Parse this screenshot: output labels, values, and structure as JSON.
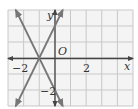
{
  "chart_data": {
    "type": "line",
    "title": "",
    "xlabel": "x",
    "ylabel": "y",
    "origin_label": "O",
    "xlim": [
      -3,
      5
    ],
    "ylim": [
      -3,
      3
    ],
    "grid": true,
    "grid_step": 1,
    "tick_labels": {
      "x": [
        {
          "value": -2,
          "label": "−2"
        },
        {
          "value": 2,
          "label": "2"
        }
      ],
      "y": [
        {
          "value": -2,
          "label": "−2"
        }
      ]
    },
    "series": [
      {
        "name": "line-positive-slope",
        "equation": "y = 2x + 2",
        "slope": 2,
        "intercept": 2,
        "x": [
          -2.5,
          0.5
        ],
        "y": [
          -3,
          3
        ]
      },
      {
        "name": "line-negative-slope",
        "equation": "y = -2x - 2",
        "slope": -2,
        "intercept": -2,
        "x": [
          -2.5,
          0.5
        ],
        "y": [
          3,
          -3
        ]
      }
    ],
    "intersection": {
      "x": -1,
      "y": 0
    },
    "colors": {
      "grid": "#c8c8c8",
      "grid_bg": "#f4f4f4",
      "axis": "#444444",
      "line": "#777777"
    }
  }
}
